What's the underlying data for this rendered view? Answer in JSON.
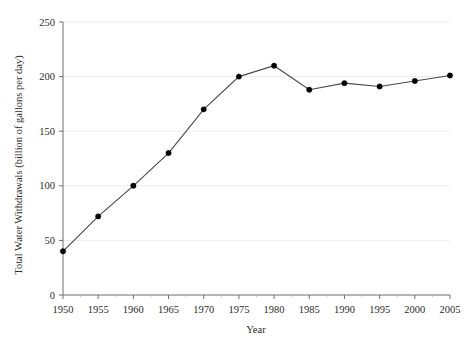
{
  "chart_data": {
    "type": "line",
    "title": "",
    "xlabel": "Year",
    "ylabel": "Total Water Withdrawals (billion of gallons per day)",
    "x": [
      1950,
      1955,
      1960,
      1965,
      1970,
      1975,
      1980,
      1985,
      1990,
      1995,
      2000,
      2005
    ],
    "values": [
      40,
      72,
      100,
      130,
      170,
      200,
      210,
      188,
      194,
      191,
      196,
      201
    ],
    "series": [
      {
        "name": "Total Water Withdrawals",
        "values": [
          40,
          72,
          100,
          130,
          170,
          200,
          210,
          188,
          194,
          191,
          196,
          201
        ]
      }
    ],
    "xlim": [
      1950,
      2005
    ],
    "ylim": [
      0,
      250
    ],
    "xticks": [
      1950,
      1955,
      1960,
      1965,
      1970,
      1975,
      1980,
      1985,
      1990,
      1995,
      2000,
      2005
    ],
    "yticks": [
      0,
      50,
      100,
      150,
      200,
      250
    ],
    "xtick_labels": [
      "1950",
      "1955",
      "1960",
      "1965",
      "1970",
      "1975",
      "1980",
      "1985",
      "1990",
      "1995",
      "2000",
      "2005"
    ],
    "ytick_labels": [
      "0",
      "50",
      "100",
      "150",
      "200",
      "250"
    ],
    "grid": "horizontal",
    "legend": "none",
    "marker": "filled-circle",
    "colors": {
      "line": "#4a4a4a",
      "marker": "#000000",
      "axis": "#6f6f6f",
      "grid": "#ececec",
      "text": "#2b2b2b",
      "background": "#ffffff"
    }
  }
}
